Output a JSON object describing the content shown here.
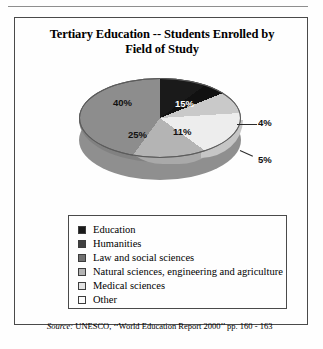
{
  "figure": {
    "title_line1": "Tertiary Education -- Students Enrolled by",
    "title_line2": "Field of Study",
    "source_prefix": "Source:",
    "source_text": "UNESCO, ‘‘World Education Report 2000’’ pp. 160 - 163"
  },
  "chart_data": {
    "type": "pie",
    "title": "Tertiary Education -- Students Enrolled by Field of Study",
    "categories": [
      "Education",
      "Humanities",
      "Law and social sciences",
      "Natural sciences, engineering and agriculture",
      "Medical sciences",
      "Other"
    ],
    "values": [
      15,
      4,
      5,
      11,
      25,
      40
    ],
    "labels": [
      "15%",
      "4%",
      "5%",
      "11%",
      "25%",
      "40%"
    ],
    "colors": [
      "#1a1a1a",
      "#111111",
      "#c9c9c9",
      "#ededed",
      "#b4b4b4",
      "#8d8d8d"
    ],
    "legend_position": "bottom",
    "three_d": true,
    "grid": false,
    "xlabel": "",
    "ylabel": "",
    "source": "UNESCO, ‘‘World Education Report 2000’’ pp. 160 - 163"
  },
  "legend": {
    "items": [
      {
        "label": "Education",
        "color": "#1a1a1a",
        "percent": "15%"
      },
      {
        "label": "Humanities",
        "color": "#3f3f3f",
        "percent": "4%"
      },
      {
        "label": "Law and social sciences",
        "color": "#707070",
        "percent": "5%"
      },
      {
        "label": "Natural sciences, engineering and agriculture",
        "color": "#b4b4b4",
        "percent": "11%"
      },
      {
        "label": "Medical sciences",
        "color": "#e2e2e2",
        "percent": "25%"
      },
      {
        "label": "Other",
        "color": "#fbfbfb",
        "percent": "40%"
      }
    ]
  },
  "slice_labels": {
    "education": "15%",
    "humanities": "4%",
    "law": "5%",
    "natural": "11%",
    "medical": "25%",
    "other": "40%"
  }
}
